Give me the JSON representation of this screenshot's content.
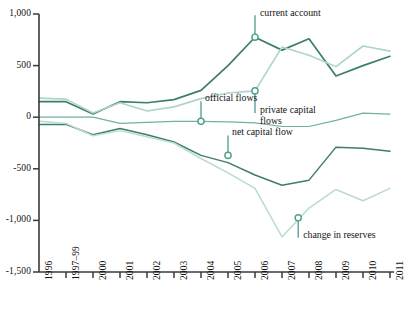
{
  "chart_data": {
    "type": "line",
    "title": "",
    "subtitle": "",
    "xlabel": "",
    "ylabel": "",
    "grid": false,
    "legend_position": "inline-annotations",
    "x": [
      "1996",
      "1997–99",
      "2000",
      "2001",
      "2002",
      "2003",
      "2004",
      "2005",
      "2006",
      "2007",
      "2008",
      "2009",
      "2010",
      "2011"
    ],
    "xlim": [
      0,
      13
    ],
    "ylim": [
      -1500,
      1000
    ],
    "ytick_labels": [
      "1,000",
      "500",
      "0",
      "-500",
      "-1,000",
      "-1,500"
    ],
    "ytick_values": [
      1000,
      500,
      0,
      -500,
      -1000,
      -1500
    ],
    "series": [
      {
        "name": "current account",
        "color": "#3d7d6e",
        "width": 1.7,
        "values": [
          150,
          150,
          30,
          150,
          140,
          170,
          260,
          500,
          775,
          650,
          760,
          400,
          500,
          590
        ]
      },
      {
        "name": "private capital flows",
        "color": "#aed4cb",
        "width": 1.6,
        "values": [
          185,
          175,
          40,
          140,
          60,
          100,
          180,
          235,
          255,
          680,
          600,
          490,
          690,
          640
        ]
      },
      {
        "name": "official flows",
        "color": "#72b0a1",
        "width": 1.2,
        "values": [
          0,
          0,
          0,
          -60,
          -50,
          -40,
          -40,
          -45,
          -55,
          -90,
          -90,
          -30,
          40,
          30
        ]
      },
      {
        "name": "net capital flow",
        "color": "#3d7d6e",
        "width": 1.5,
        "values": [
          -70,
          -70,
          -170,
          -110,
          -170,
          -240,
          -370,
          -440,
          -560,
          -660,
          -610,
          -290,
          -300,
          -330
        ]
      },
      {
        "name": "change in reserves",
        "color": "#b9dbd3",
        "width": 1.5,
        "values": [
          -40,
          -60,
          -180,
          -130,
          -190,
          -250,
          -400,
          -540,
          -690,
          -1160,
          -880,
          -700,
          -810,
          -690
        ]
      }
    ],
    "annotations": [
      {
        "name": "current account",
        "label": "current account",
        "point_x": 8,
        "point_y": 775,
        "stem_dy": -22,
        "text_dx": 5,
        "text_dy": -30,
        "align": "left"
      },
      {
        "name": "private capital flows",
        "label": "private capital\nflows",
        "point_x": 8,
        "point_y": 255,
        "stem_dy": 22,
        "text_dx": 5,
        "text_dy": 13,
        "align": "left"
      },
      {
        "name": "official flows",
        "label": "official flows",
        "point_x": 6,
        "point_y": -40,
        "stem_dy": -20,
        "text_dx": 4,
        "text_dy": -29,
        "align": "left"
      },
      {
        "name": "net capital flow",
        "label": "net capital flow",
        "point_x": 7,
        "point_y": -370,
        "stem_dy": -20,
        "text_dx": 4,
        "text_dy": -29,
        "align": "left"
      },
      {
        "name": "change in reserves",
        "label": "change in reserves",
        "point_x": 9.6,
        "point_y": -975,
        "stem_dy": 20,
        "text_dx": 5,
        "text_dy": 11,
        "align": "left"
      }
    ],
    "marker": {
      "fill": "#ffffff",
      "stroke": "#4e9d8b",
      "radius": 3.1
    },
    "axis_color": "#3a3a3a"
  },
  "axes": {
    "y_labels": [
      {
        "text": "1,000",
        "value": 1000
      },
      {
        "text": "500",
        "value": 500
      },
      {
        "text": "0",
        "value": 0
      },
      {
        "text": "-500",
        "value": -500
      },
      {
        "text": "-1,000",
        "value": -1000
      },
      {
        "text": "-1,500",
        "value": -1500
      }
    ],
    "x_labels": [
      {
        "text": "1996",
        "index": 0
      },
      {
        "text": "1997–99",
        "index": 1
      },
      {
        "text": "2000",
        "index": 2
      },
      {
        "text": "2001",
        "index": 3
      },
      {
        "text": "2002",
        "index": 4
      },
      {
        "text": "2003",
        "index": 5
      },
      {
        "text": "2004",
        "index": 6
      },
      {
        "text": "2005",
        "index": 7
      },
      {
        "text": "2006",
        "index": 8
      },
      {
        "text": "2007",
        "index": 9
      },
      {
        "text": "2008",
        "index": 10
      },
      {
        "text": "2009",
        "index": 11
      },
      {
        "text": "2010",
        "index": 12
      },
      {
        "text": "2011",
        "index": 13
      }
    ]
  }
}
